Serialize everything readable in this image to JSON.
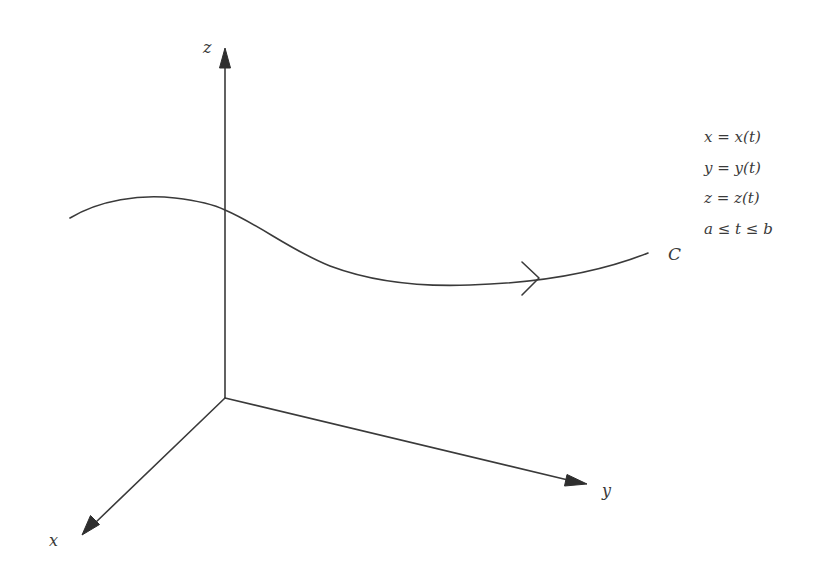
{
  "diagram": {
    "axes": {
      "x": {
        "label": "x"
      },
      "y": {
        "label": "y"
      },
      "z": {
        "label": "z"
      }
    },
    "curve": {
      "label": "C",
      "direction": "increasing t (left to right)"
    },
    "equations": [
      "x = x(t)",
      "y = y(t)",
      "z = z(t)",
      "a ≤ t ≤ b"
    ],
    "colors": {
      "stroke": "#3a3a3a",
      "background": "#ffffff"
    }
  }
}
